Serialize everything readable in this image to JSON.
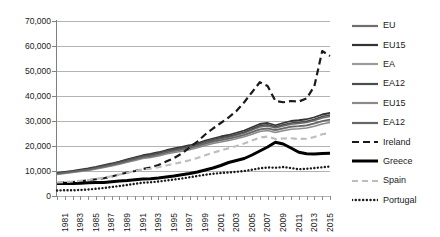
{
  "chart_data": {
    "type": "line",
    "title": "",
    "subtitle": "",
    "xlabel": "",
    "ylabel": "",
    "grid": true,
    "legend_position": "right",
    "ylim": [
      0,
      70000
    ],
    "yticks": [
      0,
      10000,
      20000,
      30000,
      40000,
      50000,
      60000,
      70000
    ],
    "ytick_labels": [
      "0",
      "10,000",
      "20,000",
      "30,000",
      "40,000",
      "50,000",
      "60,000",
      "70,000"
    ],
    "x": [
      1981,
      1982,
      1983,
      1984,
      1985,
      1986,
      1987,
      1988,
      1989,
      1990,
      1991,
      1992,
      1993,
      1994,
      1995,
      1996,
      1997,
      1998,
      1999,
      2000,
      2001,
      2002,
      2003,
      2004,
      2005,
      2006,
      2007,
      2008,
      2009,
      2010,
      2011,
      2012,
      2013,
      2014,
      2015,
      2016
    ],
    "xtick_labels": [
      "1981",
      "1983",
      "1985",
      "1987",
      "1989",
      "1991",
      "1993",
      "1995",
      "1997",
      "1999",
      "2001",
      "2003",
      "2005",
      "2007",
      "2009",
      "2011",
      "2013",
      "2015"
    ],
    "xlim": [
      1981,
      2016
    ],
    "series": [
      {
        "name": "EU",
        "style": "solid",
        "color": "#6e6e6e",
        "width": 1.6,
        "values": [
          9000,
          9400,
          9800,
          10200,
          10700,
          11300,
          11900,
          12600,
          13400,
          14200,
          15000,
          15800,
          16300,
          17000,
          17800,
          18400,
          19000,
          19600,
          20400,
          21400,
          22200,
          22900,
          23500,
          24300,
          25200,
          26400,
          27600,
          28000,
          27200,
          28000,
          28700,
          29000,
          29400,
          30200,
          31200,
          31800
        ]
      },
      {
        "name": "EU15",
        "style": "solid",
        "color": "#333333",
        "width": 1.8,
        "values": [
          9200,
          9600,
          10000,
          10500,
          11000,
          11600,
          12300,
          13000,
          13800,
          14700,
          15500,
          16300,
          16800,
          17500,
          18300,
          19000,
          19600,
          20300,
          21100,
          22200,
          23000,
          23800,
          24400,
          25300,
          26200,
          27500,
          28800,
          29200,
          28300,
          29200,
          30000,
          30300,
          30700,
          31500,
          32600,
          33200
        ]
      },
      {
        "name": "EA",
        "style": "solid",
        "color": "#9a9a9a",
        "width": 1.5,
        "values": [
          8800,
          9200,
          9600,
          10000,
          10400,
          11000,
          11600,
          12300,
          13000,
          13800,
          14600,
          15400,
          15800,
          16500,
          17300,
          17900,
          18400,
          19000,
          19800,
          20700,
          21500,
          22200,
          22800,
          23500,
          24300,
          25400,
          26500,
          26900,
          26200,
          26900,
          27600,
          27800,
          28100,
          28900,
          29800,
          30400
        ]
      },
      {
        "name": "EA12",
        "style": "solid",
        "color": "#4d4d4d",
        "width": 1.7,
        "values": [
          9100,
          9500,
          9900,
          10300,
          10800,
          11400,
          12100,
          12800,
          13600,
          14400,
          15200,
          16000,
          16500,
          17200,
          18000,
          18700,
          19300,
          19900,
          20700,
          21800,
          22600,
          23300,
          23900,
          24700,
          25600,
          26900,
          28100,
          28500,
          27700,
          28500,
          29200,
          29500,
          29900,
          30700,
          31800,
          32400
        ]
      },
      {
        "name": "EU15",
        "style": "solid",
        "color": "#8a8a8a",
        "width": 1.5,
        "values": [
          8600,
          9000,
          9400,
          9800,
          10200,
          10800,
          11400,
          12000,
          12700,
          13500,
          14200,
          15000,
          15400,
          16000,
          16800,
          17400,
          17900,
          18500,
          19300,
          20200,
          21000,
          21600,
          22200,
          22900,
          23700,
          24700,
          25800,
          26200,
          25400,
          26100,
          26700,
          26900,
          27200,
          27900,
          28800,
          29400
        ]
      },
      {
        "name": "EA12",
        "style": "solid",
        "color": "#666666",
        "width": 1.5,
        "values": [
          8900,
          9300,
          9700,
          10100,
          10500,
          11100,
          11700,
          12400,
          13100,
          13900,
          14700,
          15500,
          15900,
          16600,
          17400,
          18100,
          18600,
          19200,
          20000,
          21000,
          21800,
          22400,
          23000,
          23700,
          24500,
          25600,
          26700,
          27100,
          26400,
          27100,
          27800,
          28000,
          28300,
          29100,
          30000,
          30600
        ]
      },
      {
        "name": "Ireland",
        "style": "dashed",
        "color": "#1a1a1a",
        "width": 2.2,
        "values": [
          5200,
          5400,
          5600,
          5900,
          6300,
          6700,
          7100,
          7800,
          8600,
          9400,
          10000,
          10800,
          11400,
          12400,
          13800,
          15200,
          17000,
          19400,
          21800,
          24600,
          27000,
          29200,
          31400,
          34000,
          37500,
          41500,
          45500,
          44000,
          38000,
          37500,
          38000,
          37800,
          39000,
          44000,
          58000,
          56000
        ]
      },
      {
        "name": "Greece",
        "style": "solid-thick",
        "color": "#000000",
        "width": 3.0,
        "values": [
          5000,
          5100,
          5000,
          5100,
          5300,
          5400,
          5400,
          5700,
          6000,
          6200,
          6500,
          6800,
          6900,
          7200,
          7600,
          8000,
          8500,
          9000,
          9600,
          10400,
          11200,
          12200,
          13400,
          14200,
          15000,
          16400,
          18000,
          19600,
          21500,
          20800,
          19200,
          17500,
          16900,
          16800,
          17000,
          17100
        ]
      },
      {
        "name": "Spain",
        "style": "dashed-light",
        "color": "#bdbdbd",
        "width": 2.2,
        "values": [
          5400,
          5600,
          5800,
          6100,
          6400,
          6800,
          7300,
          7900,
          8600,
          9300,
          10000,
          10600,
          10900,
          11500,
          12200,
          12900,
          13500,
          14300,
          15200,
          16300,
          17300,
          18200,
          19100,
          20000,
          21000,
          22200,
          23400,
          23800,
          22800,
          23000,
          23100,
          22800,
          22900,
          23600,
          24700,
          25200
        ]
      },
      {
        "name": "Portugal",
        "style": "dotted",
        "color": "#1a1a1a",
        "width": 2.4,
        "values": [
          2200,
          2300,
          2300,
          2400,
          2600,
          2900,
          3200,
          3600,
          4000,
          4400,
          4900,
          5300,
          5500,
          5800,
          6200,
          6600,
          7000,
          7500,
          8000,
          8500,
          8900,
          9200,
          9400,
          9700,
          10000,
          10500,
          11100,
          11400,
          11300,
          11600,
          11200,
          10700,
          10900,
          11200,
          11500,
          11800
        ]
      }
    ]
  },
  "legend": {
    "items": [
      {
        "label": "EU",
        "swatch": "solid-gray-line-swatch"
      },
      {
        "label": "EU15",
        "swatch": "solid-darkgray-line-swatch"
      },
      {
        "label": "EA",
        "swatch": "solid-lightgray-line-swatch"
      },
      {
        "label": "EA12",
        "swatch": "solid-midgray-line-swatch"
      },
      {
        "label": "EU15",
        "swatch": "solid-gray2-line-swatch"
      },
      {
        "label": "EA12",
        "swatch": "solid-gray3-line-swatch"
      },
      {
        "label": "Ireland",
        "swatch": "dashed-black-line-swatch"
      },
      {
        "label": "Greece",
        "swatch": "thick-black-line-swatch"
      },
      {
        "label": "Spain",
        "swatch": "dashed-lightgray-line-swatch"
      },
      {
        "label": "Portugal",
        "swatch": "dotted-black-line-swatch"
      }
    ]
  }
}
